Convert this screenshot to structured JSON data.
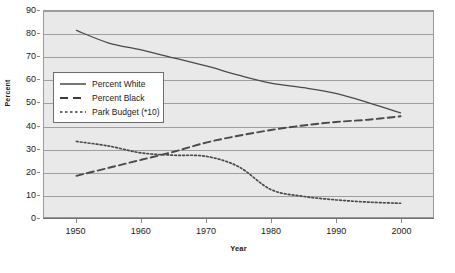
{
  "chart_data": {
    "type": "line",
    "title": "",
    "xlabel": "Year",
    "ylabel": "Percent",
    "xlim": [
      1945,
      2005
    ],
    "ylim": [
      0,
      90
    ],
    "ytick_step": 10,
    "grid": true,
    "legend_position": "upper-left-inside",
    "background_color": "#e9e9e9",
    "line_color": "#4a4a4a",
    "grid_color": "#9e9e9e",
    "border_color": "#9a9a9a",
    "x_ticks": [
      "1950",
      "1960",
      "1970",
      "1980",
      "1990",
      "2000"
    ],
    "x_tick_values": [
      1950,
      1960,
      1970,
      1980,
      1990,
      2000
    ],
    "y_ticks": [
      "0",
      "10",
      "20",
      "30",
      "40",
      "50",
      "60",
      "70",
      "80",
      "90"
    ],
    "y_tick_values": [
      0,
      10,
      20,
      30,
      40,
      50,
      60,
      70,
      80,
      90
    ],
    "series": [
      {
        "name": "Percent White",
        "style": "solid",
        "x": [
          1950,
          1955,
          1960,
          1965,
          1970,
          1975,
          1980,
          1985,
          1990,
          1995,
          2000
        ],
        "values": [
          81.5,
          76.0,
          73.0,
          69.5,
          66.0,
          62.0,
          58.5,
          56.5,
          54.0,
          50.0,
          45.5
        ]
      },
      {
        "name": "Percent Black",
        "style": "dashed",
        "x": [
          1950,
          1955,
          1960,
          1965,
          1970,
          1975,
          1980,
          1985,
          1990,
          1995,
          2000
        ],
        "values": [
          18.0,
          21.5,
          25.0,
          28.5,
          32.5,
          35.5,
          38.0,
          40.0,
          41.5,
          42.5,
          44.0
        ]
      },
      {
        "name": "Park Budget (*10)",
        "style": "dotted",
        "x": [
          1950,
          1955,
          1960,
          1965,
          1970,
          1975,
          1980,
          1985,
          1990,
          1995,
          2000
        ],
        "values": [
          33.0,
          31.0,
          28.0,
          27.0,
          26.5,
          22.0,
          12.0,
          9.0,
          7.5,
          6.5,
          6.0
        ]
      }
    ]
  },
  "legend": {
    "items": [
      {
        "label": "Percent White",
        "style": "solid"
      },
      {
        "label": "Percent Black",
        "style": "dashed"
      },
      {
        "label": "Park Budget (*10)",
        "style": "dotted"
      }
    ]
  }
}
